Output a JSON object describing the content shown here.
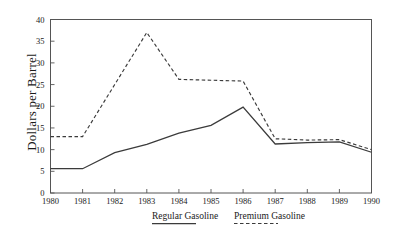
{
  "chart_data": {
    "type": "line",
    "title": "",
    "xlabel": "",
    "ylabel": "Dollars per Barrel",
    "x": [
      1980,
      1981,
      1982,
      1983,
      1984,
      1985,
      1986,
      1987,
      1988,
      1989,
      1990
    ],
    "categories": [
      "1980",
      "1981",
      "1982",
      "1983",
      "1984",
      "1985",
      "1986",
      "1987",
      "1988",
      "1989",
      "1990"
    ],
    "series": [
      {
        "name": "Regular Gasoline",
        "style": "solid",
        "color": "#3b3b3b",
        "values": [
          5.6,
          5.6,
          9.3,
          11.2,
          13.8,
          15.6,
          19.8,
          11.3,
          11.6,
          11.8,
          9.4
        ]
      },
      {
        "name": "Premium Gasoline",
        "style": "dashed",
        "color": "#3b3b3b",
        "values": [
          13.0,
          13.0,
          25.0,
          37.0,
          26.2,
          26.0,
          25.8,
          12.5,
          12.2,
          12.3,
          10.0
        ]
      }
    ],
    "ylim": [
      0,
      40
    ],
    "yticks": [
      0,
      5,
      10,
      15,
      20,
      25,
      30,
      35,
      40
    ],
    "ytick_labels": [
      "0",
      "5",
      "10",
      "15",
      "20",
      "25",
      "30",
      "35",
      "40"
    ],
    "xlim": [
      1980,
      1990
    ],
    "grid": false,
    "legend_position": "bottom"
  },
  "legend": {
    "entries": [
      {
        "label": "Regular Gasoline",
        "style": "solid"
      },
      {
        "label": "Premium Gasoline",
        "style": "dashed"
      }
    ]
  }
}
